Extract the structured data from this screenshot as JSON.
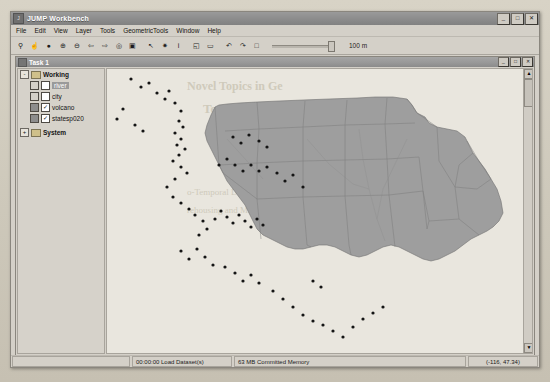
{
  "app": {
    "title": "JUMP Workbench",
    "icon": "app-icon",
    "window_buttons": [
      {
        "name": "minimize",
        "glyph": "_"
      },
      {
        "name": "maximize",
        "glyph": "□"
      },
      {
        "name": "close",
        "glyph": "✕"
      }
    ]
  },
  "menubar": {
    "items": [
      "File",
      "Edit",
      "View",
      "Layer",
      "Tools",
      "GeometricTools",
      "Window",
      "Help"
    ]
  },
  "toolbar": {
    "buttons": [
      {
        "name": "zoom-tool",
        "glyph": "⚲"
      },
      {
        "name": "pan-tool",
        "glyph": "☝"
      },
      {
        "name": "zoom-to-full-extent",
        "glyph": "●"
      },
      {
        "name": "zoom-in",
        "glyph": "⊕"
      },
      {
        "name": "zoom-out",
        "glyph": "⊖"
      },
      {
        "name": "previous-view",
        "glyph": "⇦"
      },
      {
        "name": "next-view",
        "glyph": "⇨"
      },
      {
        "name": "zoom-to-selected",
        "glyph": "◎"
      },
      {
        "name": "zoom-to-layer",
        "glyph": "▣"
      },
      {
        "name": "select-feature",
        "glyph": "↖"
      },
      {
        "name": "select-features-tool",
        "glyph": "✷"
      },
      {
        "name": "feature-info",
        "glyph": "i"
      },
      {
        "name": "draw-rectangle",
        "glyph": "◱"
      },
      {
        "name": "draw-line",
        "glyph": "▭"
      },
      {
        "name": "undo",
        "glyph": "↶"
      },
      {
        "name": "redo",
        "glyph": "↷"
      },
      {
        "name": "new-layer",
        "glyph": "□"
      }
    ],
    "slider_value": 92,
    "scale_label": "100 m"
  },
  "task_window": {
    "title": "Task 1",
    "icon": "task-icon",
    "window_buttons": [
      {
        "name": "minimize",
        "glyph": "_"
      },
      {
        "name": "maximize",
        "glyph": "□"
      },
      {
        "name": "close",
        "glyph": "✕"
      }
    ]
  },
  "layer_tree": {
    "categories": [
      {
        "label": "Working",
        "expanded": true,
        "expander_glyph": "-",
        "layers": [
          {
            "label": "river",
            "checked": false,
            "selected": true,
            "swatch": "empty"
          },
          {
            "label": "city",
            "checked": false,
            "selected": false,
            "swatch": "empty"
          },
          {
            "label": "volcano",
            "checked": true,
            "selected": false,
            "swatch": "filled"
          },
          {
            "label": "statesp020",
            "checked": true,
            "selected": false,
            "swatch": "filled"
          }
        ]
      },
      {
        "label": "System",
        "expanded": false,
        "expander_glyph": "+",
        "layers": []
      }
    ]
  },
  "map": {
    "layer_fill": "#9e9e9e",
    "layer_stroke": "#6f6f6f",
    "point_color": "#141414",
    "background": "#e9e6de"
  },
  "statusbar": {
    "task_status": "00:00:00 Load Dataset(s)",
    "memory": "63 MB Committed Memory",
    "coordinates": "(-116, 47.34)"
  },
  "background_text": {
    "lines": [
      "Novel Topics in",
      "Temporal OLAP",
      "ing and Mining",
      "OLAP"
    ]
  }
}
